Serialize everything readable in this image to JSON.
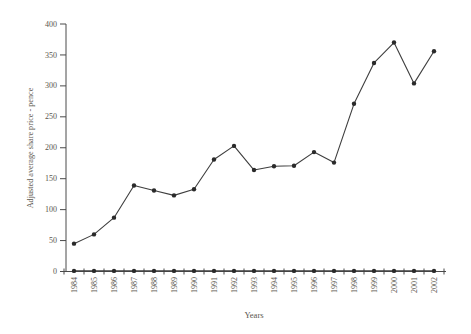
{
  "chart_data": {
    "type": "line",
    "title": "",
    "xlabel": "Years",
    "ylabel": "Adjusted average share price - pence",
    "x": [
      1984,
      1985,
      1986,
      1987,
      1988,
      1989,
      1990,
      1991,
      1992,
      1993,
      1994,
      1995,
      1996,
      1997,
      1998,
      1999,
      2000,
      2001,
      2002
    ],
    "series": [
      {
        "name": "adjusted-average-share-price",
        "values": [
          45,
          60,
          87,
          139,
          131,
          123,
          133,
          181,
          203,
          164,
          170,
          171,
          193,
          176,
          271,
          337,
          370,
          304,
          356
        ]
      },
      {
        "name": "flat-series-near-zero",
        "values": [
          1,
          1,
          1,
          1,
          1,
          1,
          1,
          1,
          1,
          1,
          1,
          1,
          1,
          1,
          1,
          1,
          1,
          1,
          1
        ]
      }
    ],
    "ylim": [
      0,
      400
    ],
    "yticks": [
      0,
      50,
      100,
      150,
      200,
      250,
      300,
      350,
      400
    ],
    "grid": false,
    "legend": "none",
    "marker": "filled-circle",
    "colors": {
      "line": "#3e3e3e",
      "marker": "#2a2a2a",
      "axis": "#4a4a4a",
      "text": "#5a564e",
      "background": "#ffffff"
    }
  }
}
